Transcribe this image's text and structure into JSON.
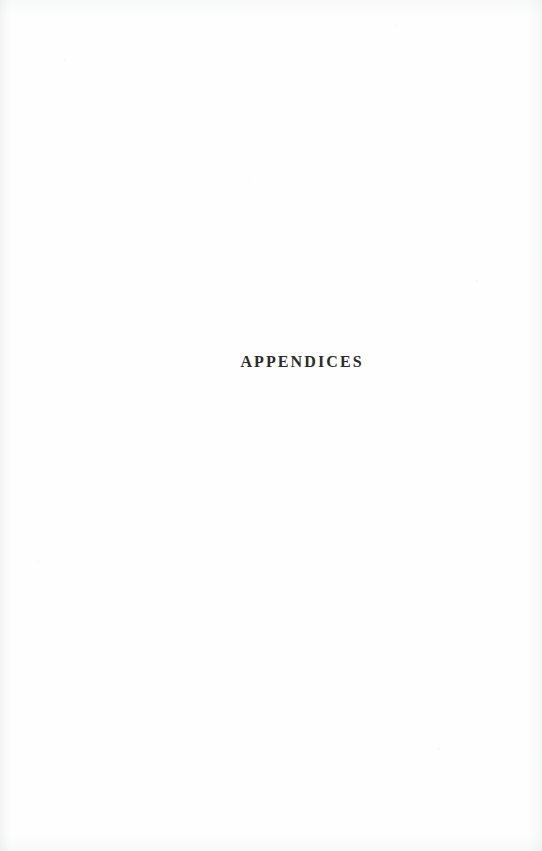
{
  "page": {
    "width": 542,
    "height": 851,
    "background_color": "#fefefe",
    "document_type": "scanned book section divider page"
  },
  "divider": {
    "title": "APPENDICES",
    "text_color": "#2b2b2b",
    "alignment": "center",
    "baseline_y": 371
  }
}
